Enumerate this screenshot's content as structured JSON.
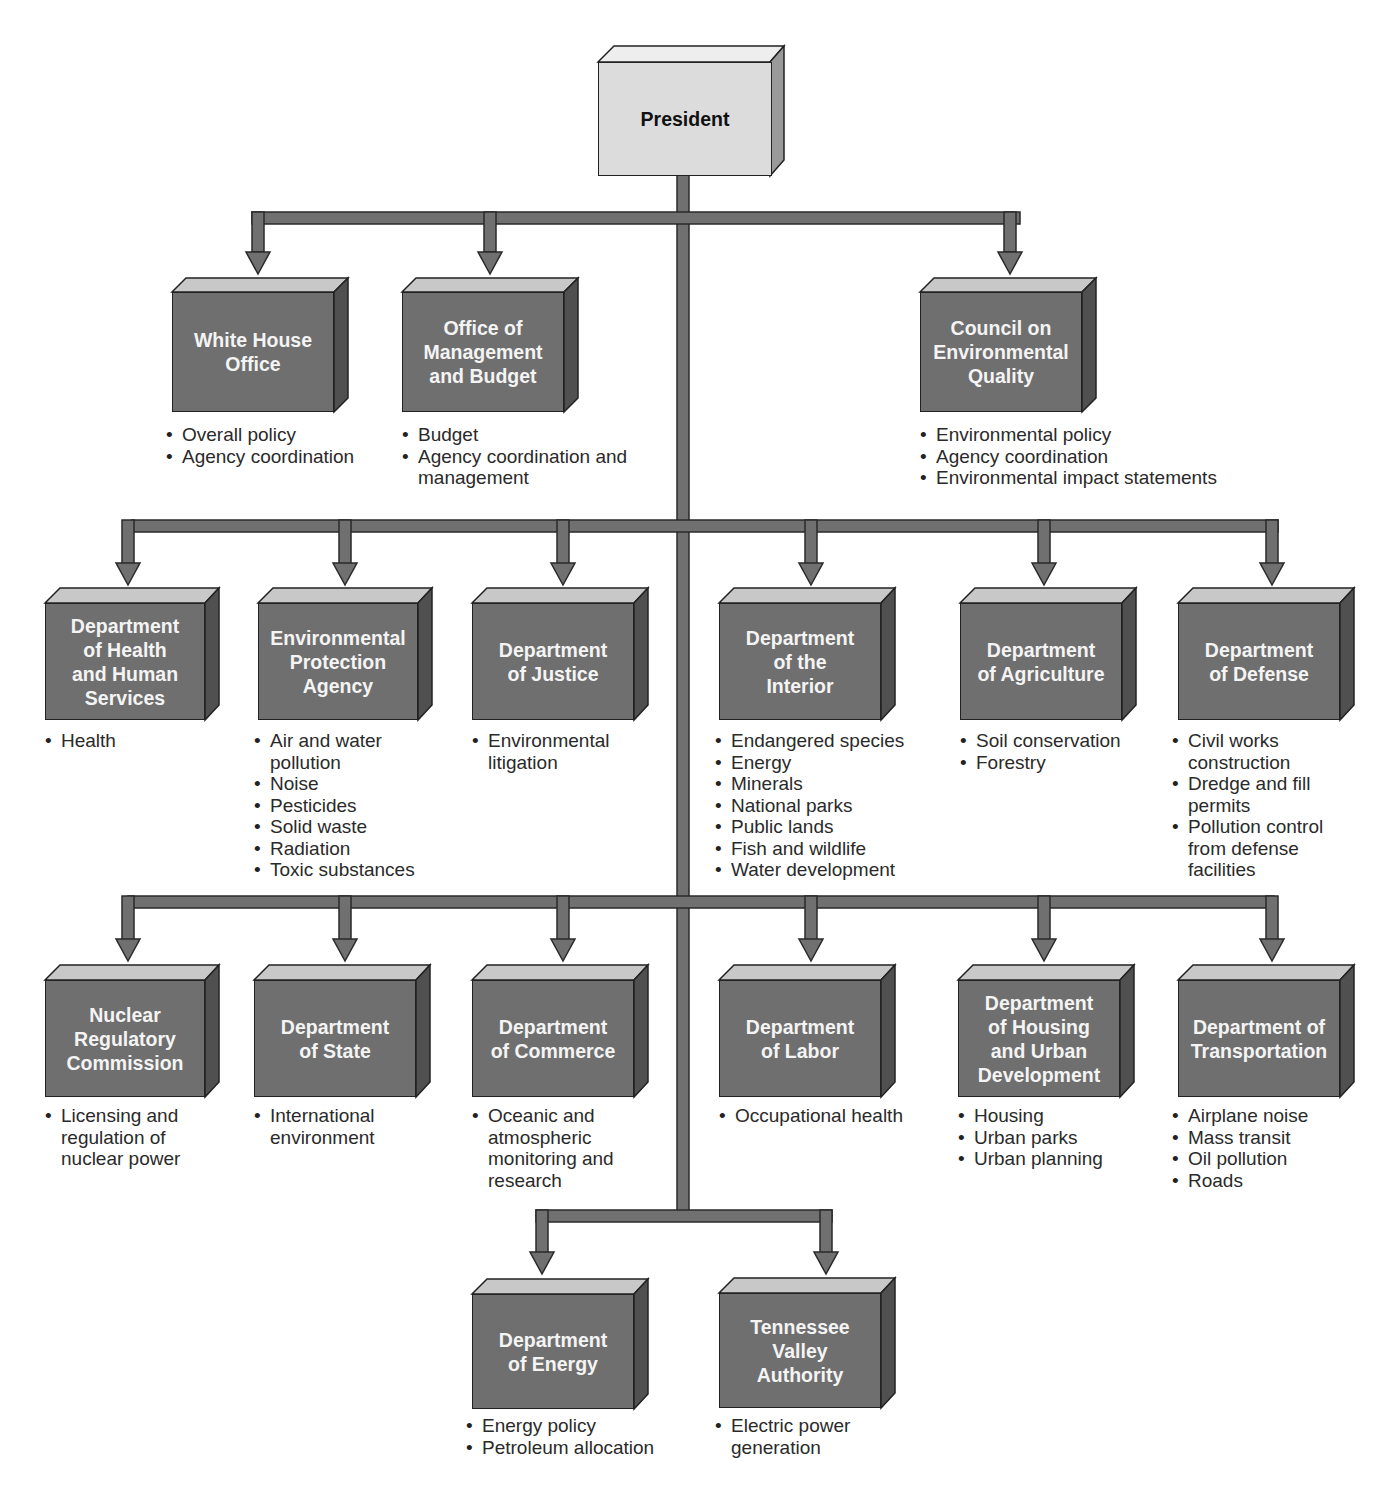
{
  "colors": {
    "connector_fill": "#707070",
    "connector_stroke": "#2a2a2a",
    "box_front": "#6f6f6f",
    "box_top": "#c8c8c8",
    "box_side": "#505050",
    "president_front": "#dcdcdc",
    "president_top": "#eeeeee",
    "president_side": "#9a9a9a",
    "text_on_box": "#f4f4f4",
    "bullet_text": "#2a2a2a"
  },
  "president": {
    "label": "President"
  },
  "tier1": [
    {
      "label": "White House\nOffice",
      "bullets": [
        "Overall policy",
        "Agency coordination"
      ]
    },
    {
      "label": "Office of\nManagement\nand Budget",
      "bullets": [
        "Budget",
        "Agency coordination and management"
      ]
    },
    {
      "label": "Council on\nEnvironmental\nQuality",
      "bullets": [
        "Environmental policy",
        "Agency coordination",
        "Environmental impact statements"
      ]
    }
  ],
  "tier2": [
    {
      "label": "Department\nof Health\nand Human\nServices",
      "bullets": [
        "Health"
      ]
    },
    {
      "label": "Environmental\nProtection\nAgency",
      "bullets": [
        "Air and water pollution",
        "Noise",
        "Pesticides",
        "Solid waste",
        "Radiation",
        "Toxic substances"
      ]
    },
    {
      "label": "Department\nof Justice",
      "bullets": [
        "Environmental litigation"
      ]
    },
    {
      "label": "Department\nof the\nInterior",
      "bullets": [
        "Endangered species",
        "Energy",
        "Minerals",
        "National parks",
        "Public lands",
        "Fish and wildlife",
        "Water development"
      ]
    },
    {
      "label": "Department\nof Agriculture",
      "bullets": [
        "Soil conservation",
        "Forestry"
      ]
    },
    {
      "label": "Department\nof Defense",
      "bullets": [
        "Civil works construction",
        "Dredge and fill permits",
        "Pollution control from defense facilities"
      ]
    }
  ],
  "tier3": [
    {
      "label": "Nuclear\nRegulatory\nCommission",
      "bullets": [
        "Licensing and regulation of nuclear power"
      ]
    },
    {
      "label": "Department\nof State",
      "bullets": [
        "International environment"
      ]
    },
    {
      "label": "Department\nof Commerce",
      "bullets": [
        "Oceanic and atmospheric monitoring and research"
      ]
    },
    {
      "label": "Department\nof Labor",
      "bullets": [
        "Occupational health"
      ]
    },
    {
      "label": "Department\nof Housing\nand Urban\nDevelopment",
      "bullets": [
        "Housing",
        "Urban parks",
        "Urban planning"
      ]
    },
    {
      "label": "Department of\nTransportation",
      "bullets": [
        "Airplane noise",
        "Mass transit",
        "Oil pollution",
        "Roads"
      ]
    }
  ],
  "tier4": [
    {
      "label": "Department\nof Energy",
      "bullets": [
        "Energy policy",
        "Petroleum allocation"
      ]
    },
    {
      "label": "Tennessee\nValley\nAuthority",
      "bullets": [
        "Electric power generation"
      ]
    }
  ]
}
